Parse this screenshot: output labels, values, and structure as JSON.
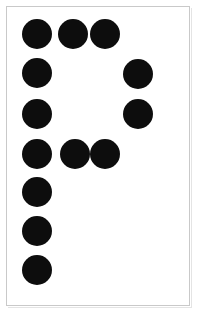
{
  "canvas": {
    "width": 203,
    "height": 321,
    "background_color": "#ffffff"
  },
  "frame": {
    "name": "card-frame",
    "x": 6,
    "y": 6,
    "width": 184,
    "height": 300,
    "border_color": "#c9c9c9",
    "border_width": 1,
    "fill_color": "#ffffff"
  },
  "figure": {
    "title": "",
    "glyph": "P",
    "dot_color": "#0d0d0d",
    "dot_diameter": 30,
    "dot_count": 14,
    "grid": {
      "columns": 4,
      "rows": 7,
      "column_x": [
        37,
        74,
        105,
        138
      ],
      "row_y": [
        34,
        73,
        114,
        154,
        192,
        231,
        270
      ]
    },
    "dots": [
      {
        "id": "dot-r1c1",
        "row": 1,
        "col": 1,
        "cx": 37,
        "cy": 34,
        "d": 30
      },
      {
        "id": "dot-r1c2",
        "row": 1,
        "col": 2,
        "cx": 73,
        "cy": 34,
        "d": 30
      },
      {
        "id": "dot-r1c3",
        "row": 1,
        "col": 3,
        "cx": 105,
        "cy": 34,
        "d": 30
      },
      {
        "id": "dot-r2c1",
        "row": 2,
        "col": 1,
        "cx": 37,
        "cy": 73,
        "d": 30
      },
      {
        "id": "dot-r2c4",
        "row": 2,
        "col": 4,
        "cx": 138,
        "cy": 74,
        "d": 30
      },
      {
        "id": "dot-r3c1",
        "row": 3,
        "col": 1,
        "cx": 37,
        "cy": 114,
        "d": 30
      },
      {
        "id": "dot-r3c4",
        "row": 3,
        "col": 4,
        "cx": 138,
        "cy": 114,
        "d": 30
      },
      {
        "id": "dot-r4c1",
        "row": 4,
        "col": 1,
        "cx": 37,
        "cy": 154,
        "d": 30
      },
      {
        "id": "dot-r4c2",
        "row": 4,
        "col": 2,
        "cx": 75,
        "cy": 154,
        "d": 30
      },
      {
        "id": "dot-r4c3",
        "row": 4,
        "col": 3,
        "cx": 105,
        "cy": 154,
        "d": 30
      },
      {
        "id": "dot-r5c1",
        "row": 5,
        "col": 1,
        "cx": 37,
        "cy": 192,
        "d": 30
      },
      {
        "id": "dot-r6c1",
        "row": 6,
        "col": 1,
        "cx": 37,
        "cy": 231,
        "d": 30
      },
      {
        "id": "dot-r7c1",
        "row": 7,
        "col": 1,
        "cx": 37,
        "cy": 270,
        "d": 30
      }
    ]
  }
}
